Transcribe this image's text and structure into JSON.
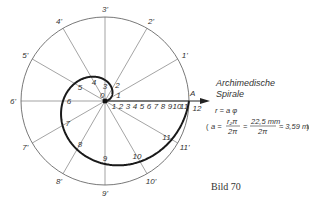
{
  "diagram": {
    "title_line1": "Archimedische",
    "title_line2": "Spirale",
    "equation": "r = a φ",
    "formula": {
      "lhs": "a =",
      "frac1_num": "r₂π",
      "frac1_den": "2π",
      "eq": "=",
      "frac2_num": "22,5 mm",
      "frac2_den": "2π",
      "approx": "≈ 3,59 mm"
    },
    "caption": "Bild 70",
    "end_point_label": "A",
    "center_label": "0",
    "outer_labels": [
      "1'",
      "2'",
      "3'",
      "4'",
      "5'",
      "6'",
      "7'",
      "8'",
      "9'",
      "10'",
      "11'",
      "12"
    ],
    "spiral_labels": [
      "1",
      "2",
      "3",
      "4",
      "5",
      "6",
      "7",
      "8",
      "9",
      "10",
      "11",
      "12"
    ],
    "scale_labels": [
      "1",
      "2",
      "3",
      "4",
      "5",
      "6",
      "7",
      "8",
      "9",
      "10",
      "11"
    ],
    "divisions": 12,
    "colors": {
      "line": "#555555",
      "spiral": "#1a1a1a",
      "text": "#333333"
    }
  }
}
